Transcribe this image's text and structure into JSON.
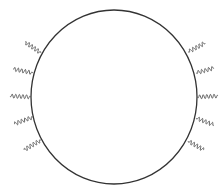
{
  "diagram": {
    "canvas": {
      "width": 224,
      "height": 196,
      "background": "#ffffff"
    },
    "loop": {
      "cx": 114,
      "cy": 97,
      "rx": 83,
      "ry": 87,
      "stroke": "#333333",
      "stroke_width": 1.3
    },
    "wavy_style": {
      "stroke": "#555555",
      "stroke_width": 0.9,
      "amplitude": 2.0,
      "wavelength": 3.6
    },
    "wavy_lines": [
      {
        "side": "left",
        "x1": 41,
        "y1": 53,
        "x2": 25,
        "y2": 42
      },
      {
        "side": "left",
        "x1": 33,
        "y1": 73,
        "x2": 13,
        "y2": 69
      },
      {
        "side": "left",
        "x1": 31,
        "y1": 97,
        "x2": 10,
        "y2": 96
      },
      {
        "side": "left",
        "x1": 33,
        "y1": 117,
        "x2": 14,
        "y2": 124
      },
      {
        "side": "left",
        "x1": 41,
        "y1": 140,
        "x2": 24,
        "y2": 150
      },
      {
        "side": "right",
        "x1": 188,
        "y1": 52,
        "x2": 205,
        "y2": 43
      },
      {
        "side": "right",
        "x1": 196,
        "y1": 73,
        "x2": 214,
        "y2": 68
      },
      {
        "side": "right",
        "x1": 197,
        "y1": 97,
        "x2": 218,
        "y2": 96
      },
      {
        "side": "right",
        "x1": 196,
        "y1": 118,
        "x2": 214,
        "y2": 125
      },
      {
        "side": "right",
        "x1": 188,
        "y1": 141,
        "x2": 204,
        "y2": 150
      }
    ]
  }
}
